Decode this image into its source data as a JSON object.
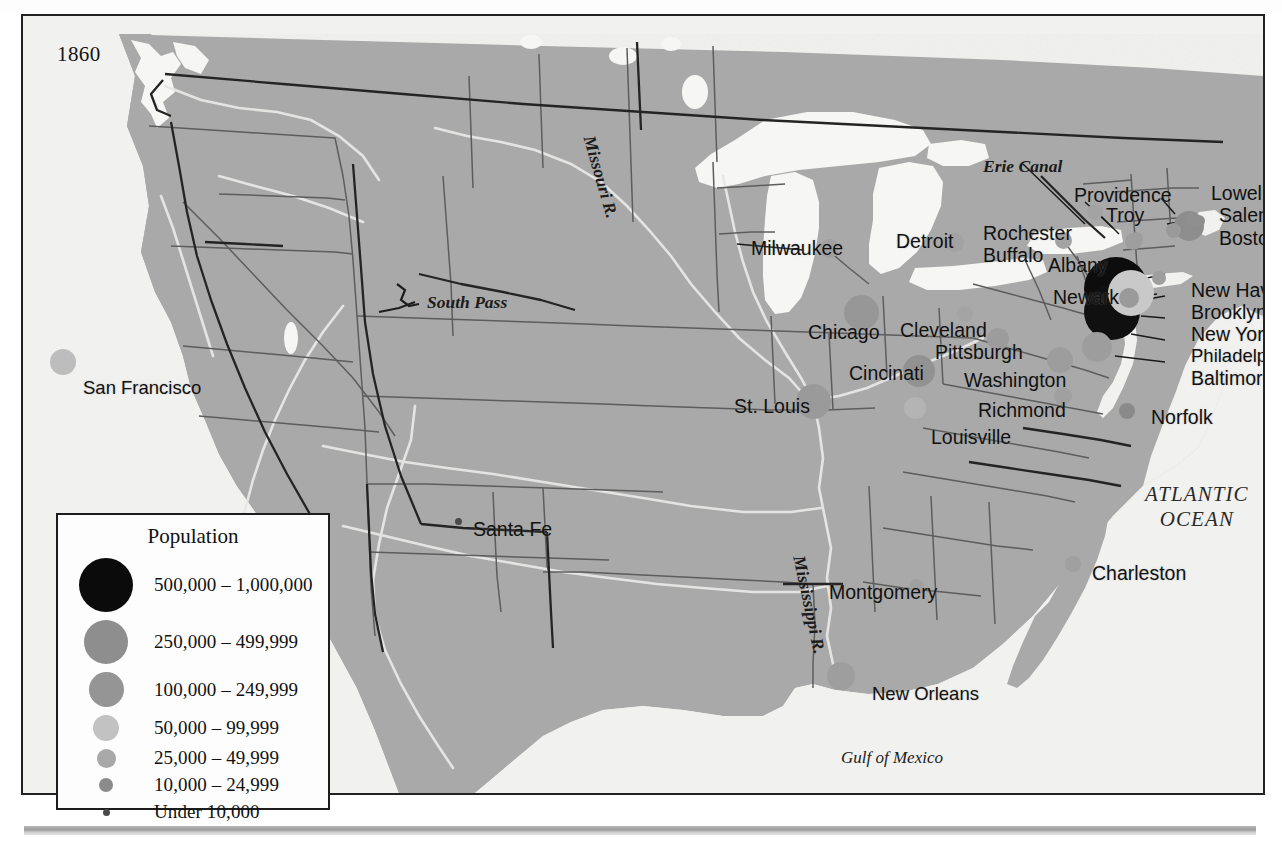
{
  "page": {
    "title_partial": "",
    "date_label": "1860"
  },
  "legend": {
    "title": "Population",
    "rows": [
      {
        "label": "500,000 – 1,000,000",
        "color": "#0b0b0b",
        "size": 54
      },
      {
        "label": "250,000 – 499,999",
        "color": "#8e8e8e",
        "size": 44
      },
      {
        "label": "100,000 – 249,999",
        "color": "#959595",
        "size": 35
      },
      {
        "label": "50,000 – 99,999",
        "color": "#c2c2c2",
        "size": 26
      },
      {
        "label": "25,000 – 49,999",
        "color": "#a8a8a8",
        "size": 19
      },
      {
        "label": "10,000 – 24,999",
        "color": "#8b8b8b",
        "size": 14
      },
      {
        "label": "Under 10,000",
        "color": "#4a4a4a",
        "size": 7
      }
    ]
  },
  "map": {
    "ocean_color": "#f1f1ef",
    "land_color": "#a9a9a9",
    "water_color": "#f6f6f4",
    "border_color": "#3a3a3a",
    "state_line_color": "#6f6f6f",
    "cities": [
      {
        "name": "San Francisco",
        "lx": 60,
        "ly": 363,
        "dx": 40,
        "dy": 346,
        "size": 26,
        "color": "#bdbdbd"
      },
      {
        "name": "Santa Fe",
        "lx": 450,
        "ly": 504,
        "dx": 435,
        "dy": 505,
        "size": 7,
        "color": "#4a4a4a"
      },
      {
        "name": "St. Louis",
        "lx": 711,
        "ly": 381,
        "dx": 790,
        "dy": 385,
        "size": 35,
        "color": "#9a9a9a"
      },
      {
        "name": "Milwaukee",
        "lx": 728,
        "ly": 223,
        "dx": 806,
        "dy": 232,
        "size": 19,
        "color": "#a0a0a0"
      },
      {
        "name": "Chicago",
        "lx": 785,
        "ly": 307,
        "dx": 838,
        "dy": 296,
        "size": 35,
        "color": "#979797"
      },
      {
        "name": "Detroit",
        "lx": 873,
        "ly": 216,
        "dx": 931,
        "dy": 226,
        "size": 19,
        "color": "#a2a2a2"
      },
      {
        "name": "Cleveland",
        "lx": 877,
        "ly": 305,
        "dx": 942,
        "dy": 298,
        "size": 16,
        "color": "#a4a4a4"
      },
      {
        "name": "Pittsburgh",
        "lx": 912,
        "ly": 327,
        "dx": 975,
        "dy": 323,
        "size": 22,
        "color": "#9c9c9c"
      },
      {
        "name": "Cincinati",
        "lx": 826,
        "ly": 348,
        "dx": 896,
        "dy": 355,
        "size": 32,
        "color": "#929292"
      },
      {
        "name": "Louisville",
        "lx": 908,
        "ly": 412,
        "dx": 892,
        "dy": 392,
        "size": 22,
        "color": "#b4b4b4"
      },
      {
        "name": "Washington",
        "lx": 941,
        "ly": 355,
        "dx": 1037,
        "dy": 344,
        "size": 26,
        "color": "#9d9d9d"
      },
      {
        "name": "Richmond",
        "lx": 955,
        "ly": 385,
        "dx": 1040,
        "dy": 380,
        "size": 18,
        "color": "#a0a0a0"
      },
      {
        "name": "Norfolk",
        "lx": 1128,
        "ly": 392,
        "dx": 1104,
        "dy": 395,
        "size": 16,
        "color": "#8a8a8a"
      },
      {
        "name": "Charleston",
        "lx": 1069,
        "ly": 548,
        "dx": 1050,
        "dy": 548,
        "size": 16,
        "color": "#a0a0a0"
      },
      {
        "name": "Montgomery",
        "lx": 806,
        "ly": 567,
        "dx": 893,
        "dy": 570,
        "size": 15,
        "color": "#a0a0a0"
      },
      {
        "name": "New Orleans",
        "lx": 849,
        "ly": 669,
        "dx": 818,
        "dy": 660,
        "size": 28,
        "color": "#9e9e9e"
      },
      {
        "name": "Rochester",
        "lx": 960,
        "ly": 208,
        "dx": 1072,
        "dy": 196,
        "size": 16,
        "color": "#a3a3a3"
      },
      {
        "name": "Buffalo",
        "lx": 960,
        "ly": 230,
        "dx": 1040,
        "dy": 224,
        "size": 17,
        "color": "#a3a3a3"
      },
      {
        "name": "Albany",
        "lx": 1025,
        "ly": 240,
        "dx": 1110,
        "dy": 225,
        "size": 17,
        "color": "#9e9e9e"
      },
      {
        "name": "Troy",
        "lx": 1083,
        "ly": 190,
        "dx": 1113,
        "dy": 222,
        "size": 13,
        "color": "#9e9e9e"
      },
      {
        "name": "Providence",
        "lx": 1051,
        "ly": 170,
        "dx": 1150,
        "dy": 214,
        "size": 15,
        "color": "#9a9a9a"
      },
      {
        "name": "Lowell",
        "lx": 1188,
        "ly": 168,
        "dx": 1168,
        "dy": 203,
        "size": 13,
        "color": "#8f8f8f"
      },
      {
        "name": "Salem",
        "lx": 1196,
        "ly": 190,
        "dx": 1176,
        "dy": 205,
        "size": 12,
        "color": "#8f8f8f"
      },
      {
        "name": "Boston",
        "lx": 1196,
        "ly": 213,
        "dx": 1166,
        "dy": 210,
        "size": 30,
        "color": "#8d8d8d"
      },
      {
        "name": "Newark",
        "lx": 1030,
        "ly": 272,
        "dx": 1106,
        "dy": 282,
        "size": 20,
        "color": "#9a9a9a"
      },
      {
        "name": "New Haven",
        "lx": 1168,
        "ly": 265,
        "dx": 1136,
        "dy": 262,
        "size": 14,
        "color": "#9e9e9e"
      },
      {
        "name": "Brooklyn",
        "lx": 1168,
        "ly": 287,
        "dx": 1108,
        "dy": 277,
        "size": 46,
        "color": "#c9c9c9"
      },
      {
        "name": "New York",
        "lx": 1168,
        "ly": 309,
        "dx": 1093,
        "dy": 273,
        "size": 64,
        "color": "#0d0d0d"
      },
      {
        "name": "Philadelphia",
        "lx": 1168,
        "ly": 331,
        "dx": 1089,
        "dy": 296,
        "size": 56,
        "color": "#101010"
      },
      {
        "name": "Baltimore",
        "lx": 1168,
        "ly": 353,
        "dx": 1074,
        "dy": 331,
        "size": 30,
        "color": "#9d9d9d"
      }
    ],
    "geo_labels": [
      {
        "name": "Missouri R.",
        "text": "Missouri R.",
        "x": 574,
        "y": 118
      },
      {
        "name": "Mississippi R.",
        "text": "Mississippi R.",
        "x": 784,
        "y": 538
      },
      {
        "name": "South Pass",
        "text": "South Pass",
        "x": 404,
        "y": 278
      },
      {
        "name": "Erie Canal",
        "text": "Erie Canal",
        "x": 960,
        "y": 142
      },
      {
        "name": "Atlantic Ocean",
        "text": "ATLANTIC\nOCEAN",
        "x": 1122,
        "y": 468
      },
      {
        "name": "Gulf of Mexico",
        "text": "Gulf of Mexico",
        "x": 818,
        "y": 733
      }
    ]
  }
}
